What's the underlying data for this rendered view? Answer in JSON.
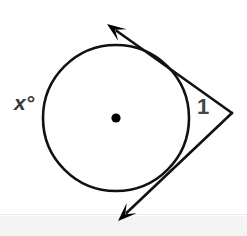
{
  "figure": {
    "background_color": "#ffffff",
    "stroke_color": "#000000",
    "labels": {
      "arc_angle": "x°",
      "vertex_angle": "1"
    },
    "label_colors": {
      "arc_angle": "#39393b",
      "vertex_angle": "#45454a"
    },
    "icons": {
      "center_point": "center-dot-icon",
      "upper_arrowhead": "arrowhead-up-left-icon",
      "lower_arrowhead": "arrowhead-down-left-icon"
    }
  },
  "chart_data": {
    "type": "diagram",
    "subtitle": "",
    "xlabel": "",
    "ylabel": "",
    "grid": false,
    "legend": "none",
    "xlim": [
      0,
      247
    ],
    "ylim": [
      0,
      236
    ],
    "shapes": [
      {
        "name": "circle",
        "kind": "circle",
        "cx": 116,
        "cy": 118,
        "r": 73,
        "stroke": "#000000",
        "stroke_width": 2.6,
        "fill": "none"
      },
      {
        "name": "center-point",
        "kind": "dot",
        "cx": 116,
        "cy": 118,
        "r": 4.6,
        "fill": "#000000"
      },
      {
        "name": "upper-tangent-ray",
        "kind": "ray",
        "from": [
          232,
          113
        ],
        "to": [
          107,
          24
        ],
        "tangent_point": [
          172,
          69
        ],
        "stroke": "#000000",
        "stroke_width": 2.6,
        "arrow_at": "to"
      },
      {
        "name": "lower-tangent-ray",
        "kind": "ray",
        "from": [
          232,
          113
        ],
        "to": [
          118,
          221
        ],
        "tangent_point": [
          177,
          161
        ],
        "stroke": "#000000",
        "stroke_width": 2.6,
        "arrow_at": "to"
      }
    ],
    "annotations": [
      {
        "name": "arc-angle-label",
        "text": "x°",
        "x": 24,
        "y": 104,
        "color": "#39393b",
        "bold": true,
        "italic": true,
        "font_size": 21
      },
      {
        "name": "vertex-angle-label",
        "text": "1",
        "x": 204,
        "y": 111,
        "color": "#45454a",
        "bold": true,
        "italic": false,
        "font_size": 22
      }
    ],
    "measurements": {
      "vertex": [
        232,
        113
      ],
      "circle_center": [
        116,
        118
      ],
      "circle_radius": 73,
      "upper_tangent_point": [
        172,
        69
      ],
      "lower_tangent_point": [
        177,
        161
      ]
    }
  }
}
